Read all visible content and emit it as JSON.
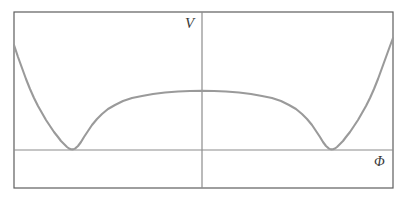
{
  "figure": {
    "title": "",
    "background_color": "#ffffff",
    "frame_color": "#5e5e5e",
    "axis_color": "#8c8c8c",
    "curve_color": "#9a9a9a",
    "label_color": "#3a3a3a",
    "width": 404,
    "height": 200
  },
  "labels": {
    "y_axis": "V",
    "x_axis": "Φ"
  },
  "chart_data": {
    "type": "line",
    "title": "",
    "xlabel": "Φ",
    "ylabel": "V",
    "grid": false,
    "legend": null,
    "xlim": [
      -1,
      1
    ],
    "ylim": [
      -0.32,
      1.18
    ],
    "axes": {
      "x_axis_at_y": 0,
      "y_axis_at_x": 0
    },
    "features": {
      "minima": [
        {
          "x": -0.704,
          "y": 0.0
        },
        {
          "x": 0.704,
          "y": 0.0
        }
      ],
      "local_maximum": {
        "x": 0.0,
        "y": 0.4
      },
      "left_endpoint": {
        "x": -1.0,
        "y": 0.9
      },
      "right_endpoint": {
        "x": 1.0,
        "y": 0.82
      }
    },
    "series": [
      {
        "name": "V(Φ)",
        "color": "#9a9a9a",
        "points_px": [
          [
            14,
            45
          ],
          [
            18,
            57
          ],
          [
            22,
            68
          ],
          [
            26,
            79
          ],
          [
            30,
            89
          ],
          [
            34,
            98
          ],
          [
            38,
            106
          ],
          [
            42,
            113
          ],
          [
            46,
            120
          ],
          [
            50,
            126
          ],
          [
            54,
            132
          ],
          [
            58,
            137
          ],
          [
            61,
            141
          ],
          [
            64,
            144
          ],
          [
            67,
            147
          ],
          [
            69,
            148.5
          ],
          [
            71,
            149.3
          ],
          [
            73,
            149.4
          ],
          [
            75,
            148.6
          ],
          [
            78,
            146
          ],
          [
            81,
            142
          ],
          [
            84,
            137
          ],
          [
            88,
            131
          ],
          [
            92,
            125
          ],
          [
            97,
            119
          ],
          [
            102,
            114
          ],
          [
            108,
            109
          ],
          [
            115,
            105
          ],
          [
            123,
            101
          ],
          [
            132,
            98
          ],
          [
            142,
            96
          ],
          [
            153,
            94
          ],
          [
            165,
            92.5
          ],
          [
            178,
            91.5
          ],
          [
            190,
            91
          ],
          [
            202,
            90.8
          ],
          [
            214,
            91
          ],
          [
            226,
            91.5
          ],
          [
            239,
            92.5
          ],
          [
            251,
            94
          ],
          [
            262,
            96
          ],
          [
            272,
            98
          ],
          [
            281,
            101
          ],
          [
            289,
            105
          ],
          [
            296,
            109
          ],
          [
            302,
            114
          ],
          [
            307,
            119
          ],
          [
            312,
            125
          ],
          [
            316,
            131
          ],
          [
            320,
            137
          ],
          [
            323,
            142
          ],
          [
            326,
            146
          ],
          [
            329,
            148.6
          ],
          [
            331,
            149.4
          ],
          [
            333,
            149.3
          ],
          [
            335,
            148.5
          ],
          [
            337,
            147
          ],
          [
            340,
            144
          ],
          [
            343,
            141
          ],
          [
            346,
            137
          ],
          [
            350,
            132
          ],
          [
            354,
            126
          ],
          [
            358,
            120
          ],
          [
            362,
            113
          ],
          [
            366,
            106
          ],
          [
            370,
            98
          ],
          [
            374,
            89
          ],
          [
            378,
            79
          ],
          [
            382,
            68
          ],
          [
            386,
            57
          ],
          [
            390,
            46
          ],
          [
            393,
            38
          ]
        ]
      }
    ]
  },
  "frame": {
    "left": 14,
    "top": 12,
    "right": 393,
    "bottom": 188
  },
  "axes_px": {
    "x_axis_y": 150,
    "y_axis_x": 202
  }
}
